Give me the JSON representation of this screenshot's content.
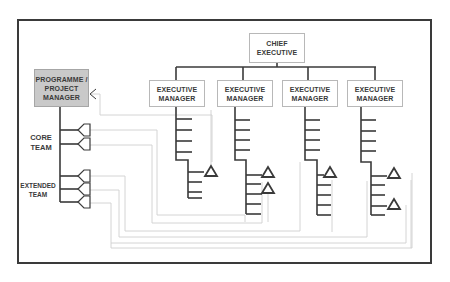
{
  "diagram": {
    "chief": {
      "label_line1": "CHIEF",
      "label_line2": "EXECUTIVE"
    },
    "executive_managers": [
      {
        "label_line1": "EXECUTIVE",
        "label_line2": "MANAGER"
      },
      {
        "label_line1": "EXECUTIVE",
        "label_line2": "MANAGER"
      },
      {
        "label_line1": "EXECUTIVE",
        "label_line2": "MANAGER"
      },
      {
        "label_line1": "EXECUTIVE",
        "label_line2": "MANAGER"
      }
    ],
    "project_manager": {
      "label_line1": "PROGRAMME /",
      "label_line2": "PROJECT",
      "label_line3": "MANAGER"
    },
    "team_labels": {
      "core_line1": "CORE",
      "core_line2": "TEAM",
      "extended_line1": "EXTENDED",
      "extended_line2": "TEAM"
    },
    "colors": {
      "frame": "#3a3a3a",
      "line": "#3a3a3a",
      "connector": "#cfcfcf",
      "pm_fill": "#c9c9c9",
      "box_border": "#b8b8b8"
    }
  }
}
